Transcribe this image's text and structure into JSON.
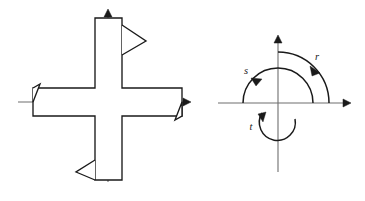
{
  "figure": {
    "title": "",
    "background_color": "#ffffff",
    "ink_color": "#1a1a1a",
    "axis_color": "#6e6e6e",
    "panels": [
      {
        "id": "left-panel",
        "name": "hatched-cross-member",
        "description": "Cross-shaped hatched structural section with barbed arm terminations on a thin two-axis reference cross",
        "axes": {
          "horizontal": {
            "x1": 18,
            "x2": 190,
            "y": 102,
            "arrow": "right"
          },
          "vertical": {
            "y1": 10,
            "y2": 182,
            "x": 108,
            "arrow": "up"
          }
        },
        "hatch_angle_deg": 45,
        "arm_labels": []
      },
      {
        "id": "right-panel",
        "name": "concentric-arc-diagram",
        "description": "Three concentric semicircular arcs with directional arrowheads on a two-axis coordinate cross",
        "axes": {
          "horizontal": {
            "x1": 218,
            "x2": 350,
            "y": 103,
            "arrow": "right"
          },
          "vertical": {
            "y1": 36,
            "y2": 172,
            "x": 278,
            "arrow": "up"
          }
        },
        "arcs": [
          {
            "label": "r",
            "radius": 70,
            "label_x": 317,
            "label_y": 60,
            "direction": "clockwise"
          },
          {
            "label": "s",
            "radius": 48,
            "label_x": 246,
            "label_y": 74,
            "direction": "clockwise"
          },
          {
            "label": "t",
            "radius": 25,
            "label_x": 251,
            "label_y": 129,
            "direction": "clockwise"
          }
        ]
      }
    ]
  }
}
